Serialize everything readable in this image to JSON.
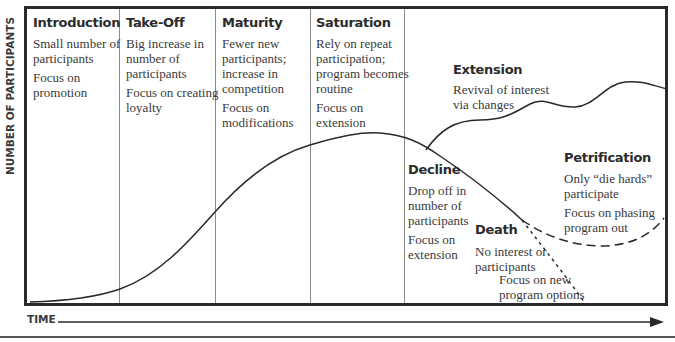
{
  "diagram": {
    "type": "program-life-cycle",
    "axes": {
      "y_label": "NUMBER OF PARTICIPANTS",
      "x_label": "TIME"
    },
    "stages": [
      {
        "title": "Introduction",
        "description": "Small number of participants",
        "description_lines": [
          "Small number of",
          "participants"
        ],
        "focus_lines": [
          "Focus on",
          "promotion"
        ]
      },
      {
        "title": "Take-Off",
        "description_lines": [
          "Big increase in",
          "number of",
          "participants"
        ],
        "focus_lines": [
          "Focus on creating",
          "loyalty"
        ]
      },
      {
        "title": "Maturity",
        "description_lines": [
          "Fewer new",
          "participants;",
          "increase in",
          "competition"
        ],
        "focus_lines": [
          "Focus on",
          "modifications"
        ]
      },
      {
        "title": "Saturation",
        "description_lines": [
          "Rely on repeat",
          "participation;",
          "program becomes",
          "routine"
        ],
        "focus_lines": [
          "Focus on",
          "extension"
        ]
      },
      {
        "title": "Decline",
        "description_lines": [
          "Drop off in",
          "number of",
          "participants"
        ],
        "focus_lines": [
          "Focus on",
          "extension"
        ]
      }
    ],
    "branches": [
      {
        "title": "Extension",
        "description_lines": [
          "Revival of interest",
          "via changes"
        ],
        "line_style": "solid-wavy"
      },
      {
        "title": "Petrification",
        "description_lines": [
          "Only “die hards”",
          "participate"
        ],
        "focus_lines": [
          "Focus on phasing",
          "program out"
        ],
        "line_style": "dashed"
      },
      {
        "title": "Death",
        "description_lines": [
          "No interest or",
          "participants"
        ],
        "focus_lines": [
          "Focus on new",
          "program options"
        ],
        "line_style": "dotted"
      }
    ],
    "colors": {
      "frame": "#2a2a2a",
      "divider": "#8a8a8a",
      "curve": "#2a2a2a",
      "text": "#3a3a3a"
    }
  }
}
